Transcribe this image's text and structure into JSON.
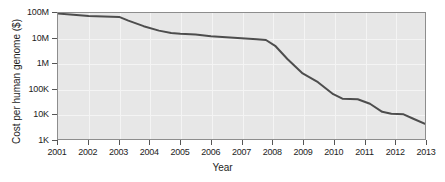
{
  "chart_data": {
    "type": "line",
    "title": "",
    "xlabel": "Year",
    "ylabel": "Cost per human genome ($)",
    "yscale": "log",
    "ylim": [
      1000,
      100000000
    ],
    "xlim": [
      2001,
      2013
    ],
    "grid": true,
    "legend": null,
    "y_ticks": [
      {
        "value": 100000000,
        "label": "100M"
      },
      {
        "value": 10000000,
        "label": "10M"
      },
      {
        "value": 1000000,
        "label": "1M"
      },
      {
        "value": 100000,
        "label": "100K"
      },
      {
        "value": 10000,
        "label": "10K"
      },
      {
        "value": 1000,
        "label": "1K"
      }
    ],
    "x_ticks": [
      {
        "value": 2001,
        "label": "2001"
      },
      {
        "value": 2002,
        "label": "2002"
      },
      {
        "value": 2003,
        "label": "2003"
      },
      {
        "value": 2004,
        "label": "2004"
      },
      {
        "value": 2005,
        "label": "2005"
      },
      {
        "value": 2006,
        "label": "2006"
      },
      {
        "value": 2007,
        "label": "2007"
      },
      {
        "value": 2008,
        "label": "2008"
      },
      {
        "value": 2009,
        "label": "2009"
      },
      {
        "value": 2010,
        "label": "2010"
      },
      {
        "value": 2011,
        "label": "2011"
      },
      {
        "value": 2012,
        "label": "2012"
      },
      {
        "value": 2013,
        "label": "2013"
      }
    ],
    "series": [
      {
        "name": "Cost per human genome",
        "color": "#4d4d4d",
        "line_width": 2,
        "x": [
          2001.0,
          2001.5,
          2002.0,
          2002.5,
          2003.0,
          2003.3,
          2003.8,
          2004.3,
          2004.7,
          2005.0,
          2005.5,
          2006.0,
          2006.5,
          2007.0,
          2007.5,
          2007.8,
          2008.1,
          2008.5,
          2009.0,
          2009.5,
          2010.0,
          2010.3,
          2010.8,
          2011.2,
          2011.6,
          2011.9,
          2012.3,
          2012.6,
          2013.0
        ],
        "y": [
          95000000,
          85000000,
          76000000,
          72000000,
          70000000,
          50000000,
          30000000,
          20000000,
          16000000,
          15000000,
          14000000,
          12000000,
          11000000,
          10000000,
          9000000,
          8500000,
          5000000,
          1500000,
          400000,
          180000,
          60000,
          40000,
          38000,
          25000,
          12000,
          10000,
          9500,
          6500,
          4000
        ]
      }
    ]
  }
}
